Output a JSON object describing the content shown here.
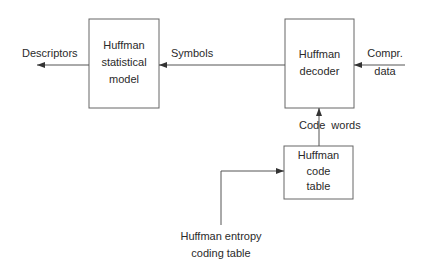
{
  "diagram": {
    "blocks": {
      "statistical_model": {
        "line1": "Huffman",
        "line2": "statistical",
        "line3": "model"
      },
      "decoder": {
        "line1": "Huffman",
        "line2": "decoder"
      },
      "code_table": {
        "line1": "Huffman",
        "line2": "code",
        "line3": "table"
      }
    },
    "labels": {
      "descriptors": "Descriptors",
      "symbols": "Symbols",
      "compr_line1": "Compr.",
      "compr_line2": "data",
      "code_words": "Code  words",
      "entropy_line1": "Huffman entropy",
      "entropy_line2": "coding table"
    },
    "colors": {
      "stroke": "#555555",
      "text": "#2a2a2a",
      "background": "#ffffff"
    }
  }
}
